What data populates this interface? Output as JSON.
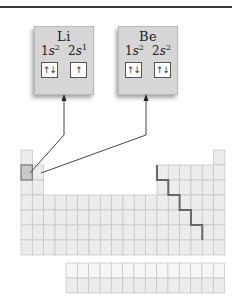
{
  "figure": {
    "elements": [
      {
        "symbol": "Li",
        "configuration": [
          {
            "orbital": "1s",
            "label_n": "1",
            "label_l": "s",
            "electrons": "2"
          },
          {
            "orbital": "2s",
            "label_n": "2",
            "label_l": "s",
            "electrons": "1"
          }
        ],
        "orbital_boxes": [
          {
            "orbital": "1s",
            "spins": "↑↓"
          },
          {
            "orbital": "2s",
            "spins": "↑"
          }
        ],
        "table_position": {
          "period": 2,
          "group": 1
        }
      },
      {
        "symbol": "Be",
        "configuration": [
          {
            "orbital": "1s",
            "label_n": "1",
            "label_l": "s",
            "electrons": "2"
          },
          {
            "orbital": "2s",
            "label_n": "2",
            "label_l": "s",
            "electrons": "2"
          }
        ],
        "orbital_boxes": [
          {
            "orbital": "1s",
            "spins": "↑↓"
          },
          {
            "orbital": "2s",
            "spins": "↑↓"
          }
        ],
        "table_position": {
          "period": 2,
          "group": 2
        }
      }
    ],
    "periodic_table": {
      "groups": 18,
      "periods": 7,
      "f_block_rows": 2,
      "f_block_columns": 14,
      "highlighted_cell": {
        "period": 2,
        "group": 1
      },
      "metalloid_staircase": true
    },
    "colors": {
      "box_fill": "#d6d6d6",
      "cell_fill": "#ececec",
      "cell_line": "#c4c4c4",
      "highlight_fill": "#c8c8c8",
      "highlight_border": "#7a7a7a",
      "staircase": "#666666",
      "leader_line": "#444444",
      "top_rule": "#3a3a3a"
    }
  }
}
